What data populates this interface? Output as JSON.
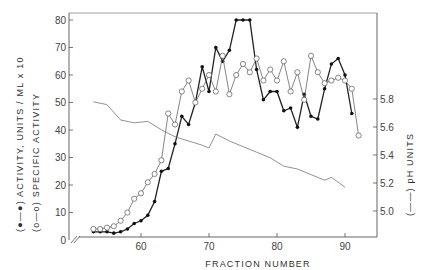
{
  "chart_data": {
    "type": "line",
    "title": "",
    "xlabel": "FRACTION NUMBER",
    "ylabel_left": "(●—●) ACTIVITY, UNITS / ML x 10   (o—o) SPECIFIC ACTIVITY",
    "ylabel_right": "(——) pH UNITS",
    "x_ticks": [
      60,
      70,
      80,
      90
    ],
    "y_left_ticks": [
      0,
      10,
      20,
      30,
      40,
      50,
      60,
      70,
      80
    ],
    "y_right_ticks": [
      "5.0",
      "5.2",
      "5.4",
      "5.6",
      "5.8"
    ],
    "xlim": [
      50,
      95
    ],
    "ylim_left": [
      0,
      82
    ],
    "ylim_right": [
      4.75,
      6.0
    ],
    "axis_break": "x-axis broken near origin (//)",
    "grid": false,
    "series": [
      {
        "name": "Activity, units/ml x 10",
        "marker": "filled-circle",
        "axis": "left",
        "x": [
          53,
          54,
          55,
          56,
          57,
          58,
          59,
          60,
          61,
          62,
          63,
          64,
          65,
          66,
          67,
          68,
          69,
          70,
          71,
          72,
          73,
          74,
          75,
          76,
          77,
          78,
          79,
          80,
          81,
          82,
          83,
          84,
          85,
          86,
          87,
          88,
          89,
          90,
          91
        ],
        "values": [
          3,
          3,
          3,
          2.5,
          3,
          4,
          6,
          7,
          9,
          14,
          25,
          26,
          35,
          45,
          42,
          50,
          63,
          54,
          70,
          65,
          69,
          80,
          80,
          80,
          62,
          51,
          54,
          54,
          47,
          48,
          41,
          53,
          45,
          44,
          55,
          64,
          66,
          60,
          46
        ]
      },
      {
        "name": "Specific activity",
        "marker": "open-circle",
        "axis": "left",
        "x": [
          53,
          54,
          55,
          56,
          57,
          58,
          59,
          60,
          61,
          62,
          63,
          64,
          65,
          66,
          67,
          68,
          69,
          70,
          71,
          72,
          73,
          74,
          75,
          76,
          77,
          78,
          79,
          80,
          81,
          82,
          83,
          84,
          85,
          86,
          87,
          88,
          89,
          90,
          91,
          92
        ],
        "values": [
          4,
          4,
          4.5,
          5,
          7,
          10,
          15,
          17,
          21,
          24,
          29,
          46,
          42,
          54,
          58,
          50,
          55,
          60,
          54,
          67,
          53,
          60,
          64,
          61,
          66,
          58,
          62,
          58,
          65,
          54,
          61,
          51,
          67,
          61,
          57,
          58,
          59,
          58,
          55,
          38
        ]
      },
      {
        "name": "pH",
        "marker": "none",
        "axis": "right",
        "x": [
          53,
          55,
          57,
          59,
          61,
          63,
          65,
          67,
          69,
          70,
          71,
          73,
          75,
          77,
          79,
          81,
          83,
          85,
          87,
          88,
          90
        ],
        "values": [
          5.78,
          5.76,
          5.65,
          5.63,
          5.64,
          5.58,
          5.53,
          5.5,
          5.47,
          5.45,
          5.55,
          5.5,
          5.46,
          5.42,
          5.38,
          5.32,
          5.3,
          5.26,
          5.22,
          5.24,
          5.17
        ]
      }
    ]
  },
  "axes": {
    "x_label": "FRACTION NUMBER",
    "left_label_line1": "(●—●)  ACTIVITY, UNITS / ML x 10",
    "left_label_line2": "(o—o)  SPECIFIC  ACTIVITY",
    "right_label": "(——)  pH  UNITS",
    "origin_label": "0"
  }
}
